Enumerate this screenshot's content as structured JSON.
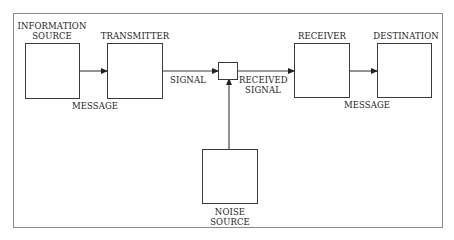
{
  "diagram": {
    "type": "block-diagram",
    "blocks": {
      "information_source": {
        "label_line1": "INFORMATION",
        "label_line2": "SOURCE"
      },
      "transmitter": {
        "label": "TRANSMITTER"
      },
      "receiver": {
        "label": "RECEIVER"
      },
      "destination": {
        "label": "DESTINATION"
      },
      "noise_source": {
        "label_line1": "NOISE",
        "label_line2": "SOURCE"
      }
    },
    "edges": {
      "message_in": {
        "label": "MESSAGE"
      },
      "signal": {
        "label": "SIGNAL"
      },
      "received_signal": {
        "label_line1": "RECEIVED",
        "label_line2": "SIGNAL"
      },
      "message_out": {
        "label": "MESSAGE"
      }
    },
    "colors": {
      "line": "#3a3a3a",
      "frame": "#8a8a8a",
      "background": "#ffffff"
    }
  }
}
